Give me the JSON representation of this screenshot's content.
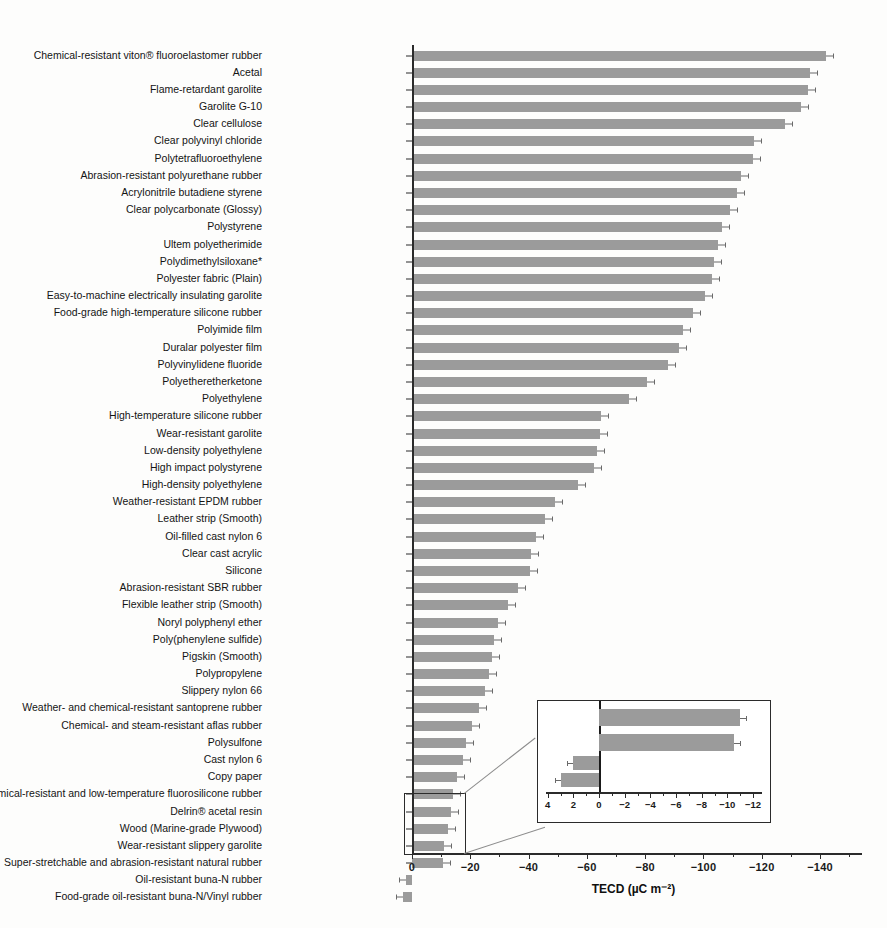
{
  "chart_data": {
    "type": "bar",
    "orientation": "horizontal",
    "title": "",
    "xlabel": "TECD (µC m⁻²)",
    "ylabel": "",
    "xlim": [
      0,
      -152
    ],
    "grid": false,
    "legend": "none",
    "xticks": [
      0,
      -20,
      -40,
      -60,
      -80,
      -100,
      -120,
      -140
    ],
    "xticklabels": [
      "0",
      "−20",
      "−40",
      "−60",
      "−80",
      "−100",
      "−120",
      "−140"
    ],
    "categories": [
      "Chemical-resistant viton® fluoroelastomer rubber",
      "Acetal",
      "Flame-retardant garolite",
      "Garolite G-10",
      "Clear cellulose",
      "Clear polyvinyl chloride",
      "Polytetrafluoroethylene",
      "Abrasion-resistant polyurethane rubber",
      "Acrylonitrile butadiene styrene",
      "Clear polycarbonate (Glossy)",
      "Polystyrene",
      "Ultem polyetherimide",
      "Polydimethylsiloxane*",
      "Polyester fabric (Plain)",
      "Easy-to-machine electrically insulating garolite",
      "Food-grade high-temperature silicone rubber",
      "Polyimide film",
      "Duralar polyester film",
      "Polyvinylidene fluoride",
      "Polyetheretherketone",
      "Polyethylene",
      "High-temperature silicone rubber",
      "Wear-resistant garolite",
      "Low-density polyethylene",
      "High impact polystyrene",
      "High-density polyethylene",
      "Weather-resistant EPDM rubber",
      "Leather strip (Smooth)",
      "Oil-filled cast nylon 6",
      "Clear cast acrylic",
      "Silicone",
      "Abrasion-resistant SBR rubber",
      "Flexible leather strip (Smooth)",
      "Noryl polyphenyl ether",
      "Poly(phenylene sulfide)",
      "Pigskin (Smooth)",
      "Polypropylene",
      "Slippery nylon 66",
      "Weather- and chemical-resistant santoprene rubber",
      "Chemical- and steam-resistant aflas rubber",
      "Polysulfone",
      "Cast nylon 6",
      "Copy paper",
      "Chemical-resistant and low-temperature fluorosilicone rubber",
      "Delrin® acetal resin",
      "Wood (Marine-grade Plywood)",
      "Wear-resistant slippery garolite",
      "Super-stretchable and abrasion-resistant natural rubber",
      "Oil-resistant buna-N rubber",
      "Food-grade oil-resistant buna-N/Vinyl rubber"
    ],
    "values": [
      -142.0,
      -136.5,
      -136.0,
      -133.5,
      -128.0,
      -117.5,
      -117.0,
      -113.0,
      -111.5,
      -109.0,
      -106.5,
      -105.0,
      -103.5,
      -103.0,
      -100.5,
      -96.5,
      -93.0,
      -91.5,
      -88.0,
      -80.5,
      -74.5,
      -65.0,
      -64.5,
      -63.5,
      -62.5,
      -57.0,
      -49.0,
      -45.5,
      -42.5,
      -41.0,
      -40.5,
      -36.5,
      -33.0,
      -29.5,
      -28.0,
      -27.5,
      -26.5,
      -25.0,
      -23.0,
      -20.5,
      -18.5,
      -17.5,
      -15.5,
      -14.0,
      -13.5,
      -12.5,
      -11.0,
      -10.5,
      2.0,
      3.0
    ],
    "errors": [
      3.5,
      3.0,
      3.0,
      3.0,
      3.0,
      2.5,
      2.5,
      2.5,
      2.5,
      2.5,
      2.5,
      2.5,
      2.5,
      2.5,
      2.5,
      2.5,
      2.0,
      2.0,
      2.0,
      2.0,
      2.0,
      2.0,
      2.0,
      2.0,
      2.0,
      2.0,
      1.8,
      1.8,
      1.8,
      1.8,
      1.8,
      1.5,
      1.5,
      1.5,
      1.5,
      1.5,
      1.5,
      1.2,
      1.2,
      1.2,
      1.2,
      1.0,
      1.0,
      1.0,
      1.0,
      1.0,
      0.8,
      0.8,
      0.5,
      0.5
    ],
    "footnote": "* Polydimethylsiloxane"
  },
  "inset": {
    "label": "inset-detail",
    "xticks": [
      4,
      2,
      0,
      -2,
      -4,
      -6,
      -8,
      -10,
      -12
    ],
    "xticklabels": [
      "4",
      "2",
      "0",
      "−2",
      "−4",
      "−6",
      "−8",
      "−10",
      "−12"
    ],
    "xlim": [
      4,
      -12
    ],
    "categories": [
      "Wear-resistant slippery garolite",
      "Super-stretchable and abrasion-resistant natural rubber",
      "Oil-resistant buna-N rubber",
      "Food-grade oil-resistant buna-N/Vinyl rubber"
    ],
    "values": [
      -11.0,
      -10.5,
      2.0,
      3.0
    ],
    "errors": [
      0.35,
      0.35,
      0.25,
      0.25
    ]
  },
  "style": {
    "bar_color": "#9b9b9b",
    "axis_color": "#2b2b2b",
    "error_color": "#6a6a6a",
    "background": "#fdfdfc"
  }
}
